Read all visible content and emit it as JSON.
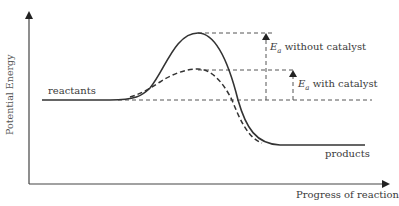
{
  "diagram": {
    "type": "reaction energy profile",
    "axes": {
      "y_label": "Potential Energy",
      "x_label": "Progress of reaction"
    },
    "labels": {
      "reactants": "reactants",
      "products": "products",
      "ea_symbol": "E",
      "ea_subscript": "a",
      "without_catalyst": " without catalyst",
      "with_catalyst": " with catalyst"
    },
    "curves": [
      {
        "name": "without catalyst",
        "style": "solid"
      },
      {
        "name": "with catalyst",
        "style": "dashed"
      }
    ],
    "colors": {
      "line": "#333333",
      "background": "#ffffff"
    }
  }
}
